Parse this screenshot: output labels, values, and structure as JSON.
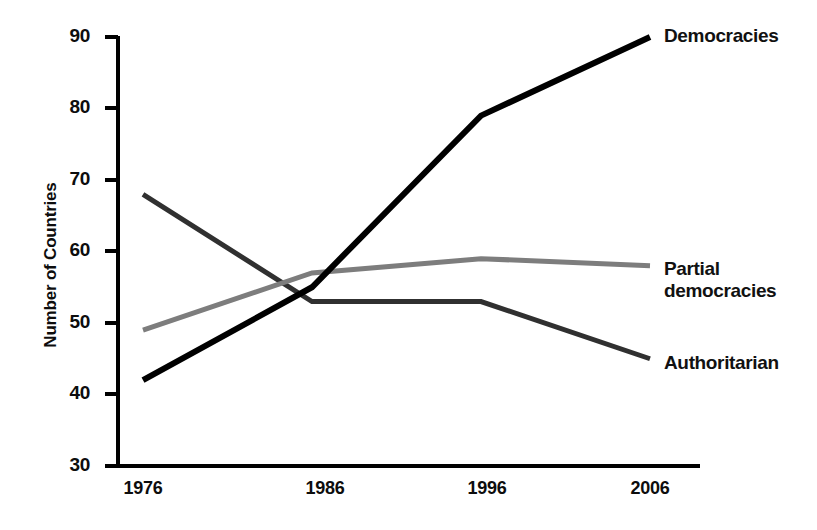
{
  "chart_data": {
    "type": "line",
    "title": "",
    "subtitle": "",
    "xlabel": "",
    "ylabel": "Number of Countries",
    "categories": [
      "1976",
      "1986",
      "1996",
      "2006"
    ],
    "x": [
      1976,
      1986,
      1996,
      2006
    ],
    "xlim": [
      1976,
      2006
    ],
    "ylim": [
      30,
      90
    ],
    "yticks": [
      "90",
      "80",
      "70",
      "60",
      "50",
      "40",
      "30"
    ],
    "ytick_values": [
      90,
      80,
      70,
      60,
      50,
      40,
      30
    ],
    "xticks": [
      "1976",
      "1986",
      "1996",
      "2006"
    ],
    "grid": false,
    "legend_position": "right-inline-end-of-line",
    "series": [
      {
        "name": "Democracies",
        "values": [
          42,
          55,
          79,
          90
        ],
        "color": "#000000",
        "width": 6
      },
      {
        "name": "Partial democracies",
        "label_lines": "Partial\ndemocracies",
        "values": [
          49,
          57,
          59,
          58
        ],
        "color": "#7d7d7d",
        "width": 5
      },
      {
        "name": "Authoritarian",
        "values": [
          68,
          53,
          53,
          45
        ],
        "color": "#303030",
        "width": 5
      }
    ],
    "axis_color": "#000000",
    "text_color": "#0d0d0d"
  },
  "labels": {
    "democracies": "Democracies",
    "partial_democracies": "Partial\ndemocracies",
    "authoritarian": "Authoritarian",
    "y_axis_title": "Number of Countries",
    "y_90": "90",
    "y_80": "80",
    "y_70": "70",
    "y_60": "60",
    "y_50": "50",
    "y_40": "40",
    "y_30": "30",
    "x_1976": "1976",
    "x_1986": "1986",
    "x_1996": "1996",
    "x_2006": "2006"
  }
}
